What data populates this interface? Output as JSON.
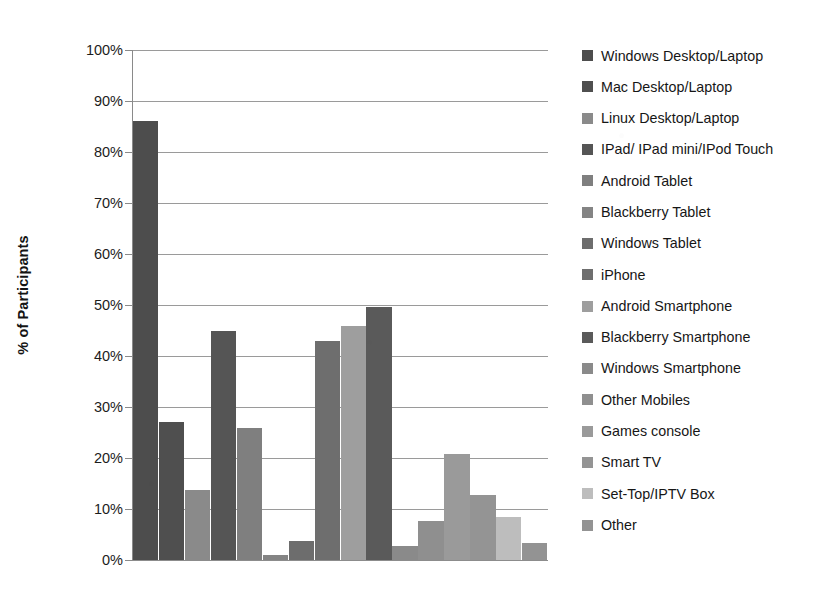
{
  "chart_data": {
    "type": "bar",
    "title": "",
    "subtitle": "",
    "xlabel": "",
    "ylabel": "% of Participants",
    "ylim": [
      0,
      100
    ],
    "ytick_labels": [
      "100%",
      "90%",
      "80%",
      "70%",
      "60%",
      "50%",
      "40%",
      "30%",
      "20%",
      "10%",
      "0%"
    ],
    "ytick_values": [
      100,
      90,
      80,
      70,
      60,
      50,
      40,
      30,
      20,
      10,
      0
    ],
    "grid": true,
    "x_tick_labels_shown": false,
    "legend_position": "right",
    "categories": [
      "Windows Desktop/Laptop",
      "Mac Desktop/Laptop",
      "Linux Desktop/Laptop",
      "IPad/ IPad mini/IPod Touch",
      "Android Tablet",
      "Blackberry Tablet",
      "Windows Tablet",
      "iPhone",
      "Android Smartphone",
      "Blackberry Smartphone",
      "Windows Smartphone",
      "Other Mobiles",
      "Games console",
      "Smart TV",
      "Set-Top/IPTV Box",
      "Other"
    ],
    "values": [
      86.0,
      27.0,
      13.7,
      44.9,
      25.9,
      1.0,
      3.7,
      43.0,
      45.8,
      49.6,
      2.7,
      7.6,
      20.7,
      12.7,
      8.4,
      3.4
    ],
    "colors": [
      "#4d4d4d",
      "#4f4f4f",
      "#8a8a8a",
      "#555555",
      "#7f7f7f",
      "#848484",
      "#6d6d6d",
      "#6e6e6e",
      "#9e9e9e",
      "#5a5a5a",
      "#8a8a8a",
      "#8f8f8f",
      "#9a9a9a",
      "#949494",
      "#bdbdbd",
      "#939393"
    ]
  },
  "legend": {
    "items": [
      {
        "label": "Windows Desktop/Laptop",
        "color": "#4d4d4d"
      },
      {
        "label": "Mac Desktop/Laptop",
        "color": "#4f4f4f"
      },
      {
        "label": "Linux Desktop/Laptop",
        "color": "#8a8a8a"
      },
      {
        "label": "IPad/ IPad mini/IPod Touch",
        "color": "#555555"
      },
      {
        "label": "Android Tablet",
        "color": "#7f7f7f"
      },
      {
        "label": "Blackberry Tablet",
        "color": "#848484"
      },
      {
        "label": "Windows Tablet",
        "color": "#6d6d6d"
      },
      {
        "label": "iPhone",
        "color": "#6e6e6e"
      },
      {
        "label": "Android Smartphone",
        "color": "#9e9e9e"
      },
      {
        "label": "Blackberry Smartphone",
        "color": "#5a5a5a"
      },
      {
        "label": "Windows Smartphone",
        "color": "#8a8a8a"
      },
      {
        "label": "Other Mobiles",
        "color": "#8f8f8f"
      },
      {
        "label": "Games console",
        "color": "#9a9a9a"
      },
      {
        "label": "Smart TV",
        "color": "#949494"
      },
      {
        "label": "Set-Top/IPTV Box",
        "color": "#bdbdbd"
      },
      {
        "label": "Other",
        "color": "#939393"
      }
    ]
  },
  "axis": {
    "y_title": "% of Participants"
  }
}
